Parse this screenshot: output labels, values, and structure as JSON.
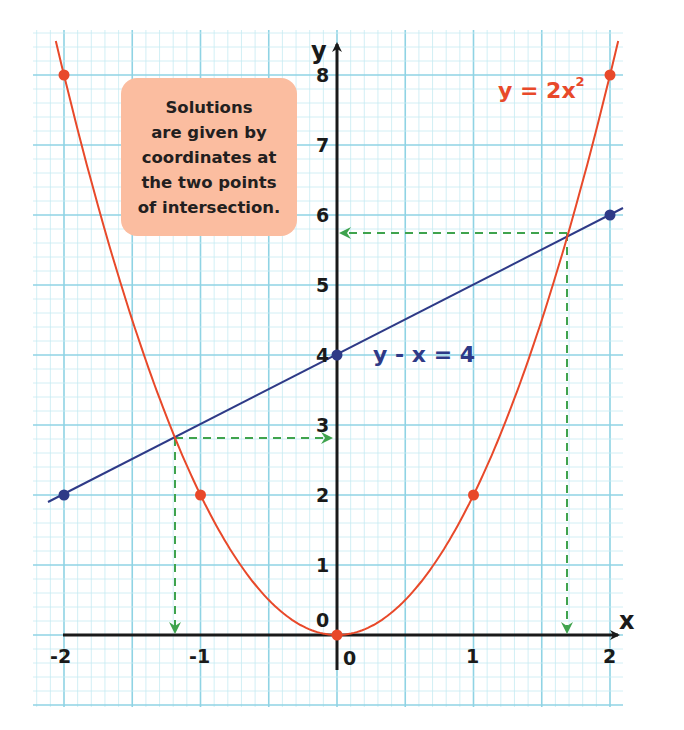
{
  "chart_data": {
    "type": "line",
    "title": "",
    "xlabel": "x",
    "ylabel": "y",
    "xlim": [
      -2,
      2
    ],
    "ylim": [
      0,
      8
    ],
    "grid": true,
    "x_ticks": [
      "-2",
      "-1",
      "0",
      "1",
      "2"
    ],
    "y_ticks": [
      "0",
      "1",
      "2",
      "3",
      "4",
      "5",
      "6",
      "7",
      "8"
    ],
    "series": [
      {
        "name": "y = 2x²",
        "kind": "curve",
        "color": "#e8492a",
        "marked_points": [
          [
            -2,
            8
          ],
          [
            -1,
            2
          ],
          [
            0,
            0
          ],
          [
            1,
            2
          ],
          [
            2,
            8
          ]
        ]
      },
      {
        "name": "y - x = 4",
        "kind": "line",
        "color": "#2e3a87",
        "marked_points": [
          [
            -2,
            2
          ],
          [
            0,
            4
          ],
          [
            2,
            6
          ]
        ]
      }
    ],
    "intersections": [
      {
        "x": -1.19,
        "y": 2.81
      },
      {
        "x": 1.69,
        "y": 5.69
      }
    ],
    "annotations": [
      "Solutions are given by coordinates at the two points of intersection."
    ]
  },
  "labels": {
    "x_axis": "x",
    "y_axis": "y",
    "origin_y": "0",
    "origin_x": "0",
    "curve_equation": "y = 2x",
    "curve_exponent": "2",
    "line_equation": "y - x = 4"
  },
  "note": {
    "lines": [
      "Solutions",
      "are given by",
      "coordinates at",
      "the two points",
      "of intersection."
    ]
  },
  "colors": {
    "curve": "#e8492a",
    "line": "#2e3a87",
    "guide": "#3fa34d",
    "grid_major": "#8fd3e4",
    "grid_minor": "#c7ebf3",
    "note_bg": "#fbbda0"
  }
}
